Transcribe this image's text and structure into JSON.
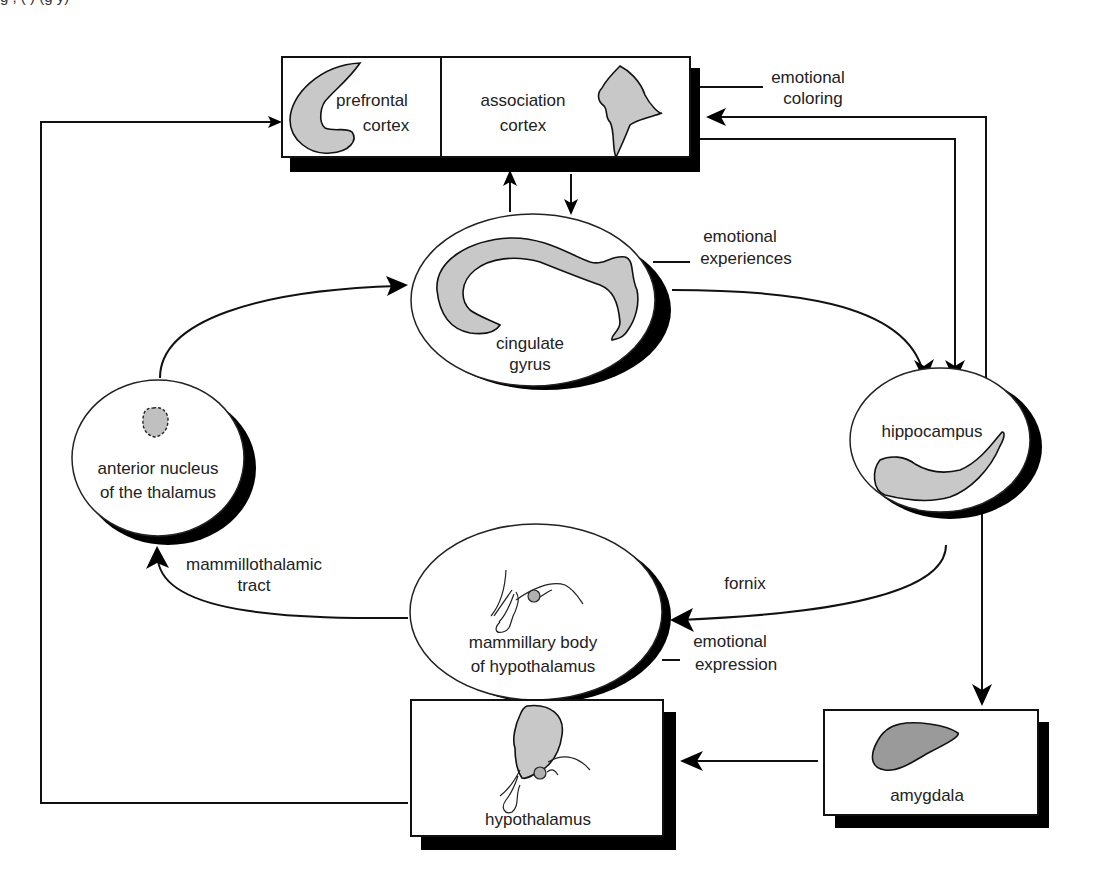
{
  "caption_fragment": "g  ,  (   )                    (g  y)",
  "diagram": {
    "nodes": {
      "prefrontal_cortex": {
        "line1": "prefrontal",
        "line2": "cortex"
      },
      "association_cortex": {
        "line1": "association",
        "line2": "cortex"
      },
      "cingulate_gyrus": {
        "line1": "cingulate",
        "line2": "gyrus"
      },
      "hippocampus": {
        "label": "hippocampus"
      },
      "anterior_thalamus": {
        "line1": "anterior nucleus",
        "line2": "of the thalamus"
      },
      "mammillary_body": {
        "line1": "mammillary body",
        "line2": "of hypothalamus"
      },
      "hypothalamus": {
        "label": "hypothalamus"
      },
      "amygdala": {
        "label": "amygdala"
      }
    },
    "edge_labels": {
      "emotional_coloring": {
        "line1": "emotional",
        "line2": "coloring"
      },
      "emotional_experiences": {
        "line1": "emotional",
        "line2": "experiences"
      },
      "mammillothalamic_tract": {
        "line1": "mammillothalamic",
        "line2": "tract"
      },
      "fornix": {
        "label": "fornix"
      },
      "emotional_expression": {
        "line1": "emotional",
        "line2": "expression"
      }
    },
    "colors": {
      "stroke": "#111111",
      "region_fill": "#c8c8c8",
      "region_dark_fill": "#9a9a9a",
      "shadow": "#000000",
      "background": "#ffffff"
    }
  }
}
